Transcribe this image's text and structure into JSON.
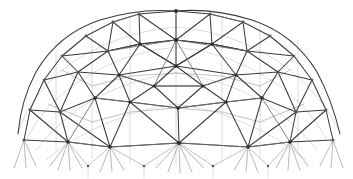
{
  "image": {
    "subject": "geodesic dome wireframe",
    "background_color": "#ffffff",
    "width": 353,
    "height": 179,
    "alt_text": "Line drawing of a hemispherical geodesic dome frame made of triangulated struts"
  },
  "render": {
    "stroke_colors": {
      "main": "#3b3b3b",
      "mid": "#6e6e6e",
      "light": "#a8a8a8",
      "faint": "#c6c6c6",
      "leg": "#9a9a9a",
      "node": "#2a2a2a"
    }
  },
  "chart_data": {
    "type": "scatter",
    "xlabel": "",
    "ylabel": "",
    "xlim": [
      0,
      353
    ],
    "ylim": [
      179,
      0
    ],
    "grid": false,
    "legend_position": "none",
    "geometry": {
      "base_line_y": 166,
      "left_extent_x": 18,
      "right_extent_x": 340,
      "apex_y": 11,
      "apex_x": 176,
      "ring_count": 5
    },
    "nodes": [
      {
        "id": 0,
        "x": 176,
        "y": 11,
        "ring": 0,
        "size": 1.9
      },
      {
        "id": 1,
        "x": 139,
        "y": 14,
        "ring": 1,
        "size": 1.5
      },
      {
        "id": 2,
        "x": 210,
        "y": 14,
        "ring": 1,
        "size": 1.5
      },
      {
        "id": 3,
        "x": 113,
        "y": 22,
        "ring": 1,
        "size": 1.4
      },
      {
        "id": 4,
        "x": 243,
        "y": 22,
        "ring": 1,
        "size": 1.4
      },
      {
        "id": 5,
        "x": 176,
        "y": 40,
        "ring": 1,
        "size": 2.1
      },
      {
        "id": 6,
        "x": 86,
        "y": 36,
        "ring": 2,
        "size": 1.4
      },
      {
        "id": 7,
        "x": 270,
        "y": 36,
        "ring": 2,
        "size": 1.4
      },
      {
        "id": 8,
        "x": 140,
        "y": 44,
        "ring": 2,
        "size": 1.6
      },
      {
        "id": 9,
        "x": 212,
        "y": 44,
        "ring": 2,
        "size": 1.6
      },
      {
        "id": 10,
        "x": 108,
        "y": 51,
        "ring": 2,
        "size": 1.5
      },
      {
        "id": 11,
        "x": 247,
        "y": 51,
        "ring": 2,
        "size": 1.5
      },
      {
        "id": 12,
        "x": 62,
        "y": 56,
        "ring": 2,
        "size": 1.3
      },
      {
        "id": 13,
        "x": 294,
        "y": 56,
        "ring": 2,
        "size": 1.3
      },
      {
        "id": 14,
        "x": 176,
        "y": 66,
        "ring": 2,
        "size": 1.7
      },
      {
        "id": 15,
        "x": 44,
        "y": 80,
        "ring": 3,
        "size": 1.3
      },
      {
        "id": 16,
        "x": 312,
        "y": 80,
        "ring": 3,
        "size": 1.3
      },
      {
        "id": 17,
        "x": 78,
        "y": 72,
        "ring": 3,
        "size": 1.5
      },
      {
        "id": 18,
        "x": 278,
        "y": 72,
        "ring": 3,
        "size": 1.5
      },
      {
        "id": 19,
        "x": 119,
        "y": 75,
        "ring": 3,
        "size": 1.6
      },
      {
        "id": 20,
        "x": 236,
        "y": 75,
        "ring": 3,
        "size": 1.6
      },
      {
        "id": 21,
        "x": 154,
        "y": 86,
        "ring": 3,
        "size": 1.6
      },
      {
        "id": 22,
        "x": 203,
        "y": 86,
        "ring": 3,
        "size": 1.6
      },
      {
        "id": 23,
        "x": 95,
        "y": 98,
        "ring": 4,
        "size": 1.7
      },
      {
        "id": 24,
        "x": 262,
        "y": 98,
        "ring": 4,
        "size": 1.7
      },
      {
        "id": 25,
        "x": 130,
        "y": 102,
        "ring": 4,
        "size": 1.6
      },
      {
        "id": 26,
        "x": 226,
        "y": 102,
        "ring": 4,
        "size": 1.6
      },
      {
        "id": 27,
        "x": 178,
        "y": 108,
        "ring": 4,
        "size": 1.7
      },
      {
        "id": 28,
        "x": 30,
        "y": 110,
        "ring": 4,
        "size": 1.4
      },
      {
        "id": 29,
        "x": 326,
        "y": 110,
        "ring": 4,
        "size": 1.4
      },
      {
        "id": 30,
        "x": 60,
        "y": 112,
        "ring": 4,
        "size": 1.5
      },
      {
        "id": 31,
        "x": 296,
        "y": 112,
        "ring": 4,
        "size": 1.5
      },
      {
        "id": 32,
        "x": 24,
        "y": 140,
        "ring": 5,
        "size": 1.5
      },
      {
        "id": 33,
        "x": 333,
        "y": 140,
        "ring": 5,
        "size": 1.5
      },
      {
        "id": 34,
        "x": 68,
        "y": 142,
        "ring": 5,
        "size": 1.8
      },
      {
        "id": 35,
        "x": 290,
        "y": 142,
        "ring": 5,
        "size": 1.8
      },
      {
        "id": 36,
        "x": 110,
        "y": 147,
        "ring": 5,
        "size": 1.7
      },
      {
        "id": 37,
        "x": 248,
        "y": 147,
        "ring": 5,
        "size": 1.7
      },
      {
        "id": 38,
        "x": 179,
        "y": 143,
        "ring": 5,
        "size": 2.0
      },
      {
        "id": 39,
        "x": 144,
        "y": 166,
        "ring": 6,
        "size": 1.3
      },
      {
        "id": 40,
        "x": 213,
        "y": 166,
        "ring": 6,
        "size": 1.3
      },
      {
        "id": 41,
        "x": 88,
        "y": 166,
        "ring": 6,
        "size": 1.2
      },
      {
        "id": 42,
        "x": 268,
        "y": 166,
        "ring": 6,
        "size": 1.2
      }
    ]
  }
}
